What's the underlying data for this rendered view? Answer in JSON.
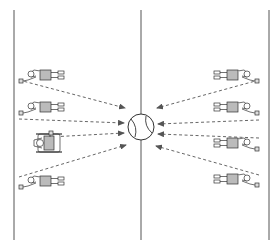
{
  "diagram": {
    "title": "",
    "colors": {
      "line": "#555555",
      "arrow": "#555555",
      "figure_stroke": "#333333",
      "figure_fill": "#ffffff",
      "figure_shade": "#bbbbbb",
      "background": "#ffffff"
    },
    "court_lines": [
      {
        "name": "left-sideline",
        "x": 14
      },
      {
        "name": "center-line",
        "x": 141
      },
      {
        "name": "right-sideline",
        "x": 269
      }
    ],
    "ball": {
      "cx": 141,
      "cy": 127,
      "r": 13,
      "icon": "tennis-ball-icon"
    },
    "players_left": [
      {
        "id": "left-player-1",
        "type": "standing",
        "y": 75,
        "racket": [
          19,
          80
        ],
        "arrow_end": [
          125,
          108
        ]
      },
      {
        "id": "left-player-2",
        "type": "standing",
        "y": 107,
        "racket": [
          19,
          119
        ],
        "arrow_end": [
          124,
          123
        ]
      },
      {
        "id": "left-player-3",
        "type": "wheelchair",
        "y": 143,
        "racket": [
          50,
          137
        ],
        "arrow_end": [
          124,
          133
        ]
      },
      {
        "id": "left-player-4",
        "type": "standing",
        "y": 181,
        "racket": [
          19,
          177
        ],
        "arrow_end": [
          126,
          145
        ]
      }
    ],
    "players_right": [
      {
        "id": "right-player-1",
        "type": "standing",
        "y": 75,
        "racket": [
          259,
          80
        ],
        "arrow_end": [
          157,
          108
        ]
      },
      {
        "id": "right-player-2",
        "type": "standing",
        "y": 107,
        "racket": [
          259,
          120
        ],
        "arrow_end": [
          158,
          124
        ]
      },
      {
        "id": "right-player-3",
        "type": "standing",
        "y": 143,
        "racket": [
          259,
          138
        ],
        "arrow_end": [
          158,
          134
        ]
      },
      {
        "id": "right-player-4",
        "type": "standing",
        "y": 179,
        "racket": [
          259,
          175
        ],
        "arrow_end": [
          156,
          146
        ]
      }
    ]
  }
}
